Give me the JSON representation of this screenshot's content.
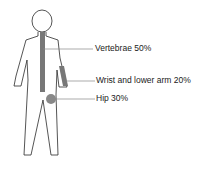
{
  "diagram": {
    "type": "body-figure-annotation",
    "labels": [
      {
        "id": "vertebrae",
        "text": "Vertebrae 50%"
      },
      {
        "id": "wrist",
        "text": "Wrist and lower arm 20%"
      },
      {
        "id": "hip",
        "text": "Hip 30%"
      }
    ],
    "colors": {
      "outline": "#2a2a2a",
      "highlight": "#777777",
      "leader": "#888888"
    }
  }
}
